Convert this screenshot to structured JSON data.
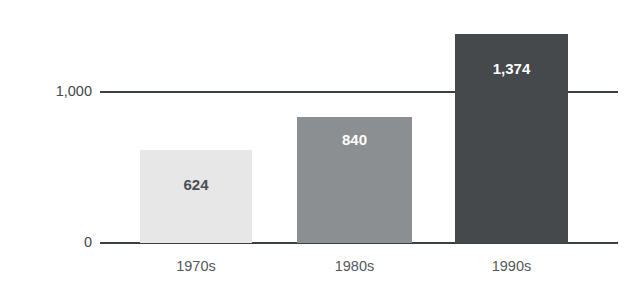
{
  "chart_data": {
    "type": "bar",
    "title": "",
    "xlabel": "",
    "ylabel": "Square miles per year",
    "categories": [
      "1970s",
      "1980s",
      "1990s"
    ],
    "values": [
      624,
      1374,
      840
    ],
    "value_labels": [
      "624",
      "840",
      "1,374"
    ],
    "series": [
      {
        "name": "Square miles per year",
        "values": [
          624,
          840,
          1374
        ]
      }
    ],
    "ytick_labels": [
      "0",
      "1,000"
    ],
    "ytick_values": [
      0,
      1000
    ],
    "ylim": [
      0,
      1660
    ],
    "grid": true,
    "legend": false,
    "bar_colors": [
      "#e7e7e7",
      "#8c8f91",
      "#46494b"
    ],
    "value_label_colors": [
      "#4b4f52",
      "#ffffff",
      "#ffffff"
    ],
    "axis_color": "#3c3f42"
  },
  "axis": {
    "y_title": "Square miles per year",
    "ticks": {
      "upper": "1,000",
      "lower": "0"
    }
  },
  "bars": [
    {
      "category": "1970s",
      "label": "624",
      "value": 624
    },
    {
      "category": "1980s",
      "label": "840",
      "value": 840
    },
    {
      "category": "1990s",
      "label": "1,374",
      "value": 1374
    }
  ]
}
